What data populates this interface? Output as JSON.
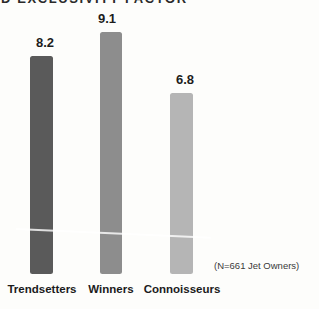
{
  "header": {
    "clipped_title_fragment": "D EXCLUSIVITY FACTOR"
  },
  "note": "(N=661 Jet Owners)",
  "colors": {
    "background": "#fdfdfb",
    "label_text": "#1b1b1b",
    "note_text": "#3a3a3a",
    "scratch_line": "rgba(255,255,255,0.8)"
  },
  "chart_data": {
    "type": "bar",
    "title": "",
    "categories": [
      "Trendsetters",
      "Winners",
      "Connoisseurs"
    ],
    "values": [
      8.2,
      9.1,
      6.8
    ],
    "value_labels": [
      "8.2",
      "9.1",
      "6.8"
    ],
    "bar_colors": [
      "#5a5a5a",
      "#8d8d8d",
      "#b5b5b5"
    ],
    "note": "(N=661 Jet Owners)",
    "xlabel": "",
    "ylabel": "",
    "grid": "off",
    "axis_lines": "none",
    "legend": "none",
    "layout": {
      "baseline_y": 274,
      "px_per_unit": 26.6,
      "bar_x": [
        30,
        100,
        170
      ],
      "bar_widths": [
        23,
        22,
        23
      ],
      "value_label_centers": [
        45,
        107,
        185
      ],
      "category_label_centers": [
        42,
        111,
        182
      ]
    }
  }
}
